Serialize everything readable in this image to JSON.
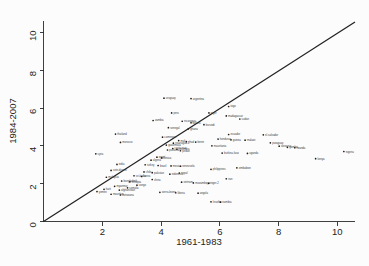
{
  "chart_data": {
    "type": "scatter",
    "title": "",
    "xlabel": "1961-1983",
    "ylabel": "1984-2007",
    "xlim": [
      0,
      10.6
    ],
    "ylim": [
      0,
      10.6
    ],
    "xticks": [
      2,
      4,
      6,
      8,
      10
    ],
    "yticks": [
      0,
      2,
      4,
      6,
      8,
      10
    ],
    "grid": false,
    "legend": null,
    "annotations": [
      {
        "name": "reference-line",
        "kind": "line",
        "equation": "y = x",
        "from": [
          0,
          0
        ],
        "to": [
          10.6,
          10.6
        ]
      }
    ],
    "points": [
      {
        "label": "argentina",
        "x": 5.02,
        "y": 6.5
      },
      {
        "label": "uruguay",
        "x": 4.1,
        "y": 6.52
      },
      {
        "label": "togo",
        "x": 6.3,
        "y": 6.08
      },
      {
        "label": "peru",
        "x": 4.36,
        "y": 5.74
      },
      {
        "label": "niger",
        "x": 5.63,
        "y": 5.74
      },
      {
        "label": "madagascar",
        "x": 6.22,
        "y": 5.58
      },
      {
        "label": "sudan",
        "x": 6.68,
        "y": 5.42
      },
      {
        "label": "zambia",
        "x": 3.73,
        "y": 5.34
      },
      {
        "label": "nicaragua",
        "x": 4.72,
        "y": 5.3
      },
      {
        "label": "bolivia",
        "x": 5.02,
        "y": 5.22
      },
      {
        "label": "burundi",
        "x": 5.46,
        "y": 5.12
      },
      {
        "label": "senegal",
        "x": 4.25,
        "y": 4.96
      },
      {
        "label": "ghana",
        "x": 4.93,
        "y": 4.9
      },
      {
        "label": "thailand",
        "x": 2.45,
        "y": 4.62
      },
      {
        "label": "ecuador",
        "x": 6.3,
        "y": 4.6
      },
      {
        "label": "el-salvador",
        "x": 7.48,
        "y": 4.58
      },
      {
        "label": "cameroon",
        "x": 4.05,
        "y": 4.46
      },
      {
        "label": "honduras",
        "x": 5.94,
        "y": 4.36
      },
      {
        "label": "guinea",
        "x": 6.38,
        "y": 4.32
      },
      {
        "label": "malawi",
        "x": 6.86,
        "y": 4.3
      },
      {
        "label": "mali",
        "x": 4.6,
        "y": 4.28
      },
      {
        "label": "chad",
        "x": 4.86,
        "y": 4.22
      },
      {
        "label": "benin",
        "x": 5.18,
        "y": 4.2
      },
      {
        "label": "morocco",
        "x": 2.62,
        "y": 4.18
      },
      {
        "label": "nicaragua-2",
        "x": 4.42,
        "y": 4.14
      },
      {
        "label": "paraguay",
        "x": 7.72,
        "y": 4.16
      },
      {
        "label": "guatemala",
        "x": 4.18,
        "y": 4.04
      },
      {
        "label": "mauritania",
        "x": 5.73,
        "y": 4.0
      },
      {
        "label": "tanzania",
        "x": 8.02,
        "y": 3.98
      },
      {
        "label": "gambia",
        "x": 8.3,
        "y": 3.92
      },
      {
        "label": "rwanda",
        "x": 8.55,
        "y": 3.9
      },
      {
        "label": "costa-rica",
        "x": 4.4,
        "y": 3.86
      },
      {
        "label": "colombia",
        "x": 4.54,
        "y": 3.82
      },
      {
        "label": "panama",
        "x": 4.22,
        "y": 3.78
      },
      {
        "label": "jordan",
        "x": 4.66,
        "y": 3.74
      },
      {
        "label": "syria",
        "x": 1.78,
        "y": 3.58
      },
      {
        "label": "nigeria",
        "x": 10.22,
        "y": 3.7
      },
      {
        "label": "burkina-faso",
        "x": 6.08,
        "y": 3.62
      },
      {
        "label": "uganda",
        "x": 6.94,
        "y": 3.6
      },
      {
        "label": "kenya",
        "x": 9.26,
        "y": 3.32
      },
      {
        "label": "egypt",
        "x": 3.86,
        "y": 3.4
      },
      {
        "label": "tunisia",
        "x": 4.02,
        "y": 3.36
      },
      {
        "label": "algeria",
        "x": 3.66,
        "y": 3.24
      },
      {
        "label": "india",
        "x": 2.5,
        "y": 3.02
      },
      {
        "label": "turkey",
        "x": 3.46,
        "y": 3.0
      },
      {
        "label": "brazil",
        "x": 3.9,
        "y": 2.96
      },
      {
        "label": "mexico",
        "x": 4.34,
        "y": 2.94
      },
      {
        "label": "venezuela",
        "x": 4.66,
        "y": 2.92
      },
      {
        "label": "zimbabwe",
        "x": 6.58,
        "y": 2.84
      },
      {
        "label": "philippines",
        "x": 5.7,
        "y": 2.76
      },
      {
        "label": "cote-divoire",
        "x": 2.3,
        "y": 2.7
      },
      {
        "label": "chile",
        "x": 3.42,
        "y": 2.62
      },
      {
        "label": "pakistan",
        "x": 3.7,
        "y": 2.58
      },
      {
        "label": "nepal",
        "x": 4.62,
        "y": 2.56
      },
      {
        "label": "indonesia",
        "x": 4.3,
        "y": 2.5
      },
      {
        "label": "sri-lanka",
        "x": 3.08,
        "y": 2.42
      },
      {
        "label": "korea",
        "x": 3.34,
        "y": 2.38
      },
      {
        "label": "malaysia",
        "x": 2.14,
        "y": 2.34
      },
      {
        "label": "china",
        "x": 3.7,
        "y": 2.22
      },
      {
        "label": "iran",
        "x": 6.22,
        "y": 2.26
      },
      {
        "label": "bangladesh",
        "x": 2.66,
        "y": 2.14
      },
      {
        "label": "ethiopia",
        "x": 2.94,
        "y": 2.1
      },
      {
        "label": "vietnam",
        "x": 4.7,
        "y": 2.08
      },
      {
        "label": "mozambique",
        "x": 5.1,
        "y": 2.04
      },
      {
        "label": "niger-2",
        "x": 5.62,
        "y": 2.02
      },
      {
        "label": "congo",
        "x": 3.18,
        "y": 1.92
      },
      {
        "label": "myanmar",
        "x": 2.42,
        "y": 1.86
      },
      {
        "label": "somalia",
        "x": 2.86,
        "y": 1.78
      },
      {
        "label": "haiti",
        "x": 2.06,
        "y": 1.7
      },
      {
        "label": "afghanistan",
        "x": 2.58,
        "y": 1.66
      },
      {
        "label": "yemen",
        "x": 1.82,
        "y": 1.58
      },
      {
        "label": "sierra-leone",
        "x": 3.96,
        "y": 1.54
      },
      {
        "label": "liberia",
        "x": 4.5,
        "y": 1.52
      },
      {
        "label": "angola",
        "x": 5.26,
        "y": 1.5
      },
      {
        "label": "mauritius",
        "x": 2.3,
        "y": 1.44
      },
      {
        "label": "botswana",
        "x": 2.62,
        "y": 1.4
      },
      {
        "label": "lesotho",
        "x": 5.7,
        "y": 1.04
      },
      {
        "label": "namibia",
        "x": 6.02,
        "y": 1.02
      }
    ]
  },
  "axes": {
    "x_title": "1961-1983",
    "y_title": "1984-2007",
    "x_tick_labels": [
      "2",
      "4",
      "6",
      "8",
      "10"
    ],
    "y_tick_labels": [
      "0",
      "2",
      "4",
      "6",
      "8",
      "10"
    ]
  },
  "colors": {
    "background": "#fcfcfc",
    "axis": "#2a2a2a",
    "line": "#222222",
    "point": "#1b1b1b",
    "label_text": "#3b3b3b"
  }
}
